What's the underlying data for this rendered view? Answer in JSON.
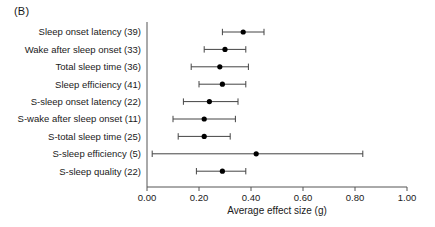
{
  "panel": {
    "label": "(B)"
  },
  "chart_data": {
    "type": "scatter",
    "subtype": "forest-plot",
    "title": "",
    "xlabel": "Average effect size (g)",
    "ylabel": "",
    "xlim": [
      0.0,
      1.0
    ],
    "xticks": [
      0.0,
      0.2,
      0.4,
      0.6,
      0.8,
      1.0
    ],
    "xticklabels": [
      "0.00",
      "0.20",
      "0.40",
      "0.60",
      "0.80",
      "1.00"
    ],
    "grid": false,
    "legend": null,
    "categories": [
      "Sleep onset latency (39)",
      "Wake after sleep onset (33)",
      "Total sleep time (36)",
      "Sleep efficiency (41)",
      "S-sleep onset latency (22)",
      "S-wake after sleep onset (11)",
      "S-total sleep time (25)",
      "S-sleep efficiency (5)",
      "S-sleep quality (22)"
    ],
    "points": [
      {
        "label": "Sleep onset latency (39)",
        "k": 39,
        "value": 0.37,
        "ci_low": 0.29,
        "ci_high": 0.45
      },
      {
        "label": "Wake after sleep onset (33)",
        "k": 33,
        "value": 0.3,
        "ci_low": 0.22,
        "ci_high": 0.38
      },
      {
        "label": "Total sleep time (36)",
        "k": 36,
        "value": 0.28,
        "ci_low": 0.17,
        "ci_high": 0.39
      },
      {
        "label": "Sleep efficiency (41)",
        "k": 41,
        "value": 0.29,
        "ci_low": 0.2,
        "ci_high": 0.38
      },
      {
        "label": "S-sleep onset latency (22)",
        "k": 22,
        "value": 0.24,
        "ci_low": 0.14,
        "ci_high": 0.35
      },
      {
        "label": "S-wake after sleep onset (11)",
        "k": 11,
        "value": 0.22,
        "ci_low": 0.1,
        "ci_high": 0.34
      },
      {
        "label": "S-total sleep time (25)",
        "k": 25,
        "value": 0.22,
        "ci_low": 0.12,
        "ci_high": 0.32
      },
      {
        "label": "S-sleep efficiency (5)",
        "k": 5,
        "value": 0.42,
        "ci_low": 0.02,
        "ci_high": 0.83
      },
      {
        "label": "S-sleep quality (22)",
        "k": 22,
        "value": 0.29,
        "ci_low": 0.19,
        "ci_high": 0.38
      }
    ]
  },
  "colors": {
    "point": "#000000",
    "ci": "#444444",
    "axis": "#555555",
    "text": "#1a1a1a",
    "background": "#ffffff"
  }
}
